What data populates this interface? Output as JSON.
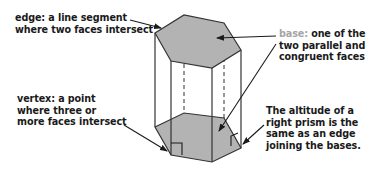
{
  "figure": {
    "fill_color": "#b3b3b3",
    "stroke_color": "#333333",
    "highlight_color": "#a6a6a6"
  },
  "labels": {
    "edge": {
      "term": "edge:",
      "line1_rest": " a line segment",
      "line2": "where two faces intersect"
    },
    "base": {
      "term": "base:",
      "line1_rest": " one of the",
      "line2": "two parallel and",
      "line3": "congruent faces"
    },
    "vertex": {
      "line1": "vertex: a point",
      "line2": "where three or",
      "line3": "more faces intersect"
    },
    "altitude": {
      "line1": "The altitude of a",
      "line2": "right prism is the",
      "line3": "same as an edge",
      "line4": "joining the bases."
    }
  }
}
